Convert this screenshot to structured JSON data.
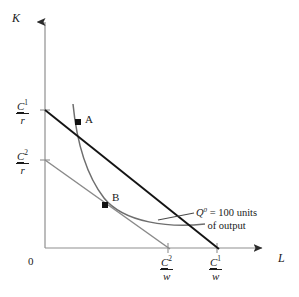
{
  "figure": {
    "background": "#ffffff",
    "axes": {
      "y_label": "K",
      "x_label": "L",
      "origin_label": "0",
      "axis_color": "#808080",
      "y_axis_x": 45,
      "x_axis_y": 248,
      "y_axis_top": 18,
      "x_axis_right": 268
    },
    "y_intercepts": [
      {
        "name": "C1-over-r",
        "numerator": "C",
        "superscript": "1",
        "denominator": "r",
        "y_px": 110
      },
      {
        "name": "C2-over-r",
        "numerator": "C",
        "superscript": "2",
        "denominator": "r",
        "y_px": 160
      }
    ],
    "x_intercepts": [
      {
        "name": "C2-over-w",
        "numerator": "C",
        "superscript": "2",
        "denominator": "w",
        "x_px": 168
      },
      {
        "name": "C1-over-w",
        "numerator": "C",
        "superscript": "1",
        "denominator": "w",
        "x_px": 217
      }
    ],
    "isocost_lines": [
      {
        "name": "isocost-C1",
        "color": "#141414",
        "width": 1.9,
        "from": [
          45,
          110
        ],
        "to": [
          217,
          248
        ]
      },
      {
        "name": "isocost-C2",
        "color": "#8a8a8a",
        "width": 1.5,
        "from": [
          45,
          160
        ],
        "to": [
          168,
          248
        ]
      }
    ],
    "isoquant": {
      "name": "isoquant-Q0",
      "color": "#6e6e6e",
      "width": 1.5,
      "annotation_line1": "Q",
      "annotation_superscript": "0",
      "annotation_line1_rest": " = 100 units",
      "annotation_line2": "of output",
      "leader_from": [
        196,
        212
      ],
      "leader_to": [
        160,
        219
      ]
    },
    "points": [
      {
        "name": "point-A",
        "label": "A",
        "x_px": 78,
        "y_px": 122,
        "marker": "square",
        "size": 5
      },
      {
        "name": "point-B",
        "label": "B",
        "x_px": 105,
        "y_px": 205,
        "marker": "square",
        "size": 5
      }
    ]
  }
}
